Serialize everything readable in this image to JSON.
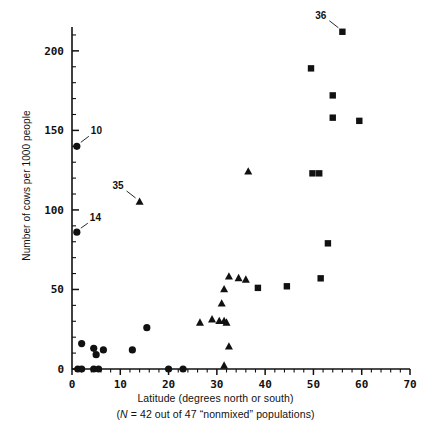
{
  "chart_data": {
    "type": "scatter",
    "title": "",
    "xlabel": "Latitude (degrees north or south)",
    "ylabel": "Number of cows per 1000 people",
    "subcaption": "(N = 42 out of 47 \"nonmixed\" populations)",
    "subcaption_italic_part": "N",
    "subcaption_rest": " = 42 out of 47 “nonmixed” populations)",
    "subcaption_open": "(",
    "xlim": [
      0,
      70
    ],
    "ylim": [
      0,
      215
    ],
    "xticks": [
      0,
      10,
      20,
      30,
      40,
      50,
      60,
      70
    ],
    "xtick_labels": [
      "0",
      "10",
      "20",
      "30",
      "40",
      "50",
      "60",
      "70"
    ],
    "xminor_step": 2,
    "yticks": [
      0,
      50,
      100,
      150,
      200
    ],
    "ytick_labels": [
      "0",
      "50",
      "100",
      "150",
      "200"
    ],
    "yminor_step": 10,
    "grid": false,
    "legend_position": "none",
    "series": [
      {
        "name": "circle-group",
        "marker": "circle",
        "color": "#111111",
        "points": [
          {
            "x": 1.0,
            "y": 140,
            "label": "10"
          },
          {
            "x": 1.0,
            "y": 86,
            "label": "14"
          },
          {
            "x": 2.0,
            "y": 16
          },
          {
            "x": 4.5,
            "y": 13
          },
          {
            "x": 5.0,
            "y": 9
          },
          {
            "x": 6.5,
            "y": 12
          },
          {
            "x": 12.5,
            "y": 12
          },
          {
            "x": 15.5,
            "y": 26
          },
          {
            "x": 1.2,
            "y": 0
          },
          {
            "x": 2.0,
            "y": 0
          },
          {
            "x": 4.5,
            "y": 0
          },
          {
            "x": 5.5,
            "y": 0
          },
          {
            "x": 20.0,
            "y": 0
          },
          {
            "x": 23.0,
            "y": 0
          }
        ]
      },
      {
        "name": "triangle-group",
        "marker": "triangle",
        "color": "#111111",
        "points": [
          {
            "x": 14.0,
            "y": 105,
            "label": "35"
          },
          {
            "x": 36.5,
            "y": 124
          },
          {
            "x": 32.5,
            "y": 58
          },
          {
            "x": 34.5,
            "y": 57
          },
          {
            "x": 36.0,
            "y": 56
          },
          {
            "x": 31.5,
            "y": 50
          },
          {
            "x": 31.0,
            "y": 41
          },
          {
            "x": 29.0,
            "y": 31
          },
          {
            "x": 30.5,
            "y": 30
          },
          {
            "x": 31.5,
            "y": 30
          },
          {
            "x": 32.0,
            "y": 29
          },
          {
            "x": 26.5,
            "y": 29
          },
          {
            "x": 32.5,
            "y": 14
          },
          {
            "x": 31.5,
            "y": 2
          }
        ]
      },
      {
        "name": "square-group",
        "marker": "square",
        "color": "#111111",
        "points": [
          {
            "x": 56.0,
            "y": 212,
            "label": "36"
          },
          {
            "x": 49.5,
            "y": 189
          },
          {
            "x": 54.0,
            "y": 172
          },
          {
            "x": 54.0,
            "y": 158
          },
          {
            "x": 59.5,
            "y": 156
          },
          {
            "x": 49.8,
            "y": 123
          },
          {
            "x": 51.2,
            "y": 123
          },
          {
            "x": 53.0,
            "y": 79
          },
          {
            "x": 44.5,
            "y": 52
          },
          {
            "x": 38.5,
            "y": 51
          },
          {
            "x": 51.5,
            "y": 57
          }
        ]
      }
    ],
    "annotations": [
      {
        "text": "10",
        "target_x": 1.0,
        "target_y": 140
      },
      {
        "text": "14",
        "target_x": 1.0,
        "target_y": 86
      },
      {
        "text": "35",
        "target_x": 14.0,
        "target_y": 105
      },
      {
        "text": "36",
        "target_x": 56.0,
        "target_y": 212
      }
    ]
  },
  "figure": {
    "background_color": "#ffffff",
    "ink_color": "#111111"
  }
}
